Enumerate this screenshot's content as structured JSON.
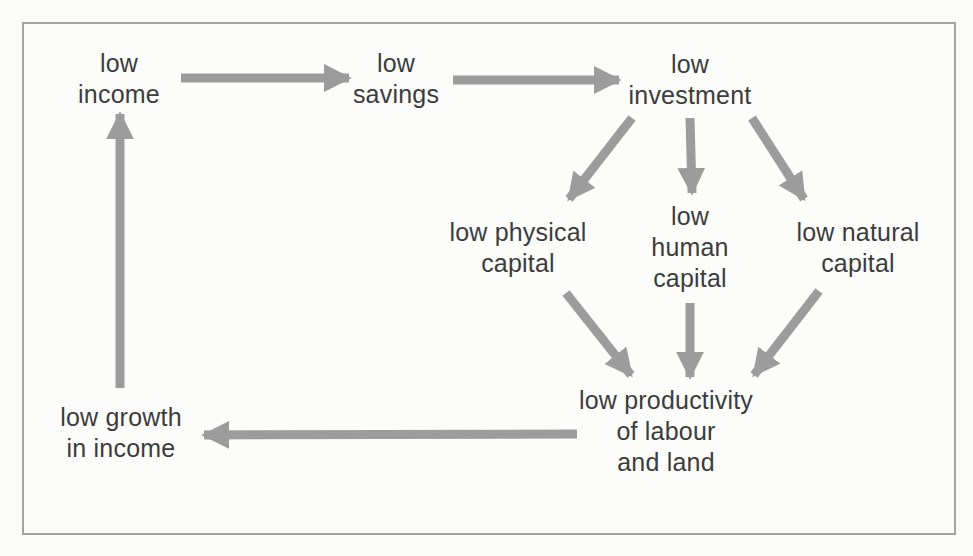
{
  "colors": {
    "arrow_gray": "#9c9c9c",
    "text_dark": "#3c3c3c",
    "frame_border": "#a3a3a3",
    "background": "#fcfcfb"
  },
  "nodes": [
    {
      "id": "low-income",
      "lines": [
        "low",
        "income"
      ]
    },
    {
      "id": "low-savings",
      "lines": [
        "low",
        "savings"
      ]
    },
    {
      "id": "low-investment",
      "lines": [
        "low",
        "investment"
      ]
    },
    {
      "id": "low-physical-capital",
      "lines": [
        "low physical",
        "capital"
      ]
    },
    {
      "id": "low-human-capital",
      "lines": [
        "low",
        "human",
        "capital"
      ]
    },
    {
      "id": "low-natural-capital",
      "lines": [
        "low natural",
        "capital"
      ]
    },
    {
      "id": "low-productivity",
      "lines": [
        "low productivity",
        "of labour",
        "and land"
      ]
    },
    {
      "id": "low-growth-in-income",
      "lines": [
        "low growth",
        "in income"
      ]
    }
  ],
  "edges": [
    {
      "from": "low-income",
      "to": "low-savings"
    },
    {
      "from": "low-savings",
      "to": "low-investment"
    },
    {
      "from": "low-investment",
      "to": "low-physical-capital"
    },
    {
      "from": "low-investment",
      "to": "low-human-capital"
    },
    {
      "from": "low-investment",
      "to": "low-natural-capital"
    },
    {
      "from": "low-physical-capital",
      "to": "low-productivity"
    },
    {
      "from": "low-human-capital",
      "to": "low-productivity"
    },
    {
      "from": "low-natural-capital",
      "to": "low-productivity"
    },
    {
      "from": "low-productivity",
      "to": "low-growth-in-income"
    },
    {
      "from": "low-growth-in-income",
      "to": "low-income"
    }
  ]
}
